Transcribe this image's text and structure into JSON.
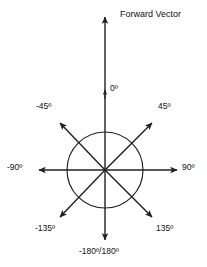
{
  "diagram": {
    "title": "Forward Vector",
    "stroke_color": "#231f20",
    "background_color": "#ffffff",
    "center": {
      "x": 105,
      "y": 170
    },
    "circle_radius": 38,
    "labels": {
      "forward_vector": "Forward Vector",
      "zero": "0º",
      "minus45": "-45º",
      "plus45": "45º",
      "minus90": "-90º",
      "plus90": "90º",
      "minus135": "-135º",
      "plus135": "135º",
      "half_turn": "-180º/180º"
    },
    "vectors": [
      {
        "name": "up",
        "angle_label": "0º",
        "direction": "up"
      },
      {
        "name": "upper-right",
        "angle_label": "45º",
        "direction": "upper-right"
      },
      {
        "name": "right",
        "angle_label": "90º",
        "direction": "right"
      },
      {
        "name": "lower-right",
        "angle_label": "135º",
        "direction": "lower-right"
      },
      {
        "name": "down",
        "angle_label": "-180º/180º",
        "direction": "down"
      },
      {
        "name": "lower-left",
        "angle_label": "-135º",
        "direction": "lower-left"
      },
      {
        "name": "left",
        "angle_label": "-90º",
        "direction": "left"
      },
      {
        "name": "upper-left",
        "angle_label": "-45º",
        "direction": "upper-left"
      }
    ]
  }
}
